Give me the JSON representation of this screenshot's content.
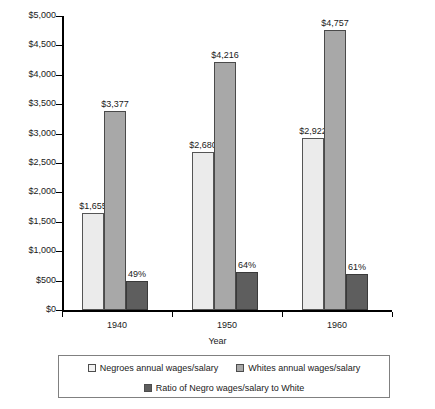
{
  "chart_data": {
    "type": "bar",
    "title": "",
    "xlabel": "Year",
    "ylabel": "",
    "categories": [
      "1940",
      "1950",
      "1960"
    ],
    "ylim": [
      0,
      5000
    ],
    "ytick_values": [
      0,
      500,
      1000,
      1500,
      2000,
      2500,
      3000,
      3500,
      4000,
      4500,
      5000
    ],
    "ytick_labels": [
      "$0",
      "$500",
      "$1,000",
      "$1,500",
      "$2,000",
      "$2,500",
      "$3,000",
      "$3,500",
      "$4,000",
      "$4,500",
      "$5,000"
    ],
    "grid": false,
    "legend_position": "bottom",
    "series": [
      {
        "name": "Negroes annual wages/salary",
        "color": "#ebebeb",
        "values": [
          1655,
          2680,
          2922
        ],
        "labels": [
          "$1,655",
          "$2,680",
          "$2,922"
        ]
      },
      {
        "name": "Whites annual wages/salary",
        "color": "#a8a8a8",
        "values": [
          3377,
          4216,
          4757
        ],
        "labels": [
          "$3,377",
          "$4,216",
          "$4,757"
        ]
      },
      {
        "name": "Ratio of Negro wages/salary to White",
        "color": "#5e5e5e",
        "values": [
          490,
          640,
          610
        ],
        "labels": [
          "49%",
          "64%",
          "61%"
        ]
      }
    ]
  },
  "legend": {
    "items": [
      {
        "label": "Negroes annual wages/salary"
      },
      {
        "label": "Whites annual wages/salary"
      },
      {
        "label": "Ratio of Negro wages/salary to White"
      }
    ]
  }
}
